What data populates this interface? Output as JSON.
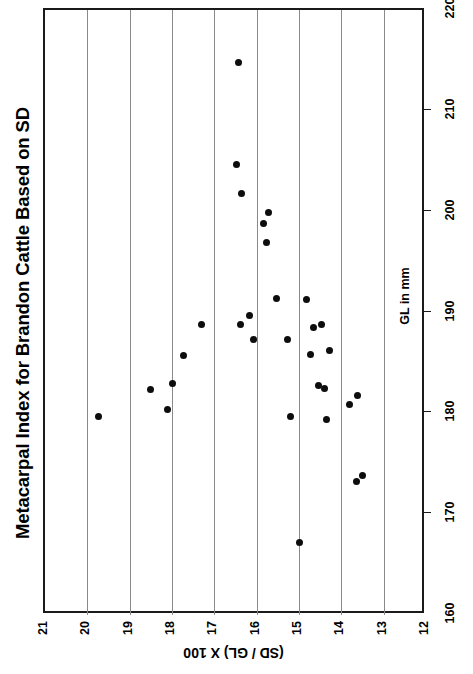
{
  "chart_data": {
    "type": "scatter",
    "title": "Metacarpal Index for Brandon Cattle Based on SD",
    "orientation": "rotated-90",
    "xlabel": "(SD / GL) X 100",
    "ylabel": "GL in mm",
    "xlim": [
      12,
      21
    ],
    "ylim": [
      160,
      220
    ],
    "xticks": [
      21,
      20,
      19,
      18,
      17,
      16,
      15,
      14,
      13,
      12
    ],
    "yticks": [
      160,
      170,
      180,
      190,
      200,
      210,
      220
    ],
    "xtick_labels": [
      "21",
      "20",
      "19",
      "18",
      "17",
      "16",
      "15",
      "14",
      "13",
      "12"
    ],
    "ytick_labels": [
      "160",
      "170",
      "180",
      "190",
      "200",
      "210",
      "220"
    ],
    "grid": "vertical-only",
    "legend": null,
    "marker": "filled-circle",
    "marker_color": "#0d0d0d",
    "n_points": 31,
    "points": [
      {
        "index": 16.42,
        "gl": 214.8
      },
      {
        "index": 16.47,
        "gl": 204.7
      },
      {
        "index": 16.35,
        "gl": 201.8
      },
      {
        "index": 15.73,
        "gl": 199.9
      },
      {
        "index": 15.85,
        "gl": 198.8
      },
      {
        "index": 15.76,
        "gl": 196.9
      },
      {
        "index": 15.54,
        "gl": 191.4
      },
      {
        "index": 14.83,
        "gl": 191.3
      },
      {
        "index": 16.16,
        "gl": 189.7
      },
      {
        "index": 17.31,
        "gl": 188.8
      },
      {
        "index": 16.39,
        "gl": 188.8
      },
      {
        "index": 14.48,
        "gl": 188.8
      },
      {
        "index": 14.65,
        "gl": 188.5
      },
      {
        "index": 16.08,
        "gl": 187.3
      },
      {
        "index": 15.28,
        "gl": 187.3
      },
      {
        "index": 14.27,
        "gl": 186.2
      },
      {
        "index": 17.72,
        "gl": 185.7
      },
      {
        "index": 14.72,
        "gl": 185.8
      },
      {
        "index": 17.98,
        "gl": 183.0
      },
      {
        "index": 18.52,
        "gl": 182.4
      },
      {
        "index": 14.55,
        "gl": 182.8
      },
      {
        "index": 14.39,
        "gl": 182.5
      },
      {
        "index": 18.1,
        "gl": 180.4
      },
      {
        "index": 13.82,
        "gl": 180.9
      },
      {
        "index": 13.61,
        "gl": 181.8
      },
      {
        "index": 15.21,
        "gl": 179.7
      },
      {
        "index": 19.73,
        "gl": 179.7
      },
      {
        "index": 14.34,
        "gl": 179.4
      },
      {
        "index": 13.51,
        "gl": 173.8
      },
      {
        "index": 13.65,
        "gl": 173.2
      },
      {
        "index": 15.0,
        "gl": 167.2
      }
    ]
  }
}
